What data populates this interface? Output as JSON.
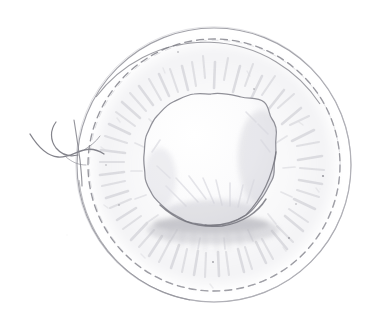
{
  "image": {
    "title": "Pencil sketch of an ovum with surrounding corona radiata",
    "medium": "graphite pencil on white paper",
    "width": 372,
    "height": 326,
    "background_color": "#ffffff",
    "line_color": "#8d8d93",
    "shade_color": "#c9c9cf",
    "dark_accent_color": "#6e6e75"
  },
  "figure": {
    "outer_circle": {
      "name": "outer boundary circle",
      "center_x": 214,
      "center_y": 165,
      "radius": 137,
      "stroke": "#9a9aa1",
      "stroke_width": 1.1,
      "style": "solid"
    },
    "dashed_circle": {
      "name": "inner dashed circle",
      "center_x": 214,
      "center_y": 165,
      "radius": 126,
      "stroke": "#8a8a91",
      "stroke_width": 1.3,
      "style": "dashed",
      "dash_pattern": "7 5"
    },
    "corona_hatching": {
      "name": "radial hatch marks between circles",
      "count": 72,
      "inner_radius": 70,
      "outer_radius": 124,
      "stroke": "#cfcfd5",
      "opacity": 0.55
    },
    "central_mass": {
      "name": "oocyte central mass",
      "center_x": 211,
      "center_y": 160,
      "radius": 66,
      "contour": "scalloped wavy outline",
      "lobes": 17,
      "lobe_amplitude": 3.4,
      "stroke": "#8f8f96",
      "stroke_width": 1.2,
      "fill": "#fdfdfd",
      "bottom_shadow": true,
      "bottom_shadow_color": "#b7b7be"
    },
    "sperm_tail": {
      "name": "sperm flagellum squiggle at left",
      "entry_x": 84,
      "entry_y": 148,
      "extent_left_x": 30,
      "stroke": "#86868d",
      "stroke_width": 1.3,
      "strand_count": 3
    }
  },
  "labels": {
    "caption": "",
    "annotations": []
  }
}
